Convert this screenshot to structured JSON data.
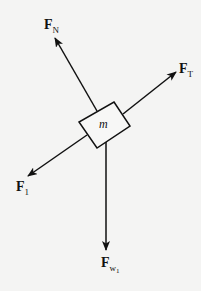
{
  "diagram": {
    "type": "free-body-diagram",
    "object": {
      "label": "m",
      "shape": "rectangle",
      "rotation_deg": -33
    },
    "forces": [
      {
        "id": "normal",
        "symbol": "F",
        "subscript": "N",
        "direction": "up-left"
      },
      {
        "id": "tension",
        "symbol": "F",
        "subscript": "T",
        "direction": "up-right"
      },
      {
        "id": "f1",
        "symbol": "F",
        "subscript": "1",
        "direction": "down-left"
      },
      {
        "id": "weight",
        "symbol": "F",
        "subscript": "w",
        "subsubscript": "1",
        "direction": "down"
      }
    ],
    "colors": {
      "line": "#111111",
      "background": "#f4f4f3"
    }
  }
}
